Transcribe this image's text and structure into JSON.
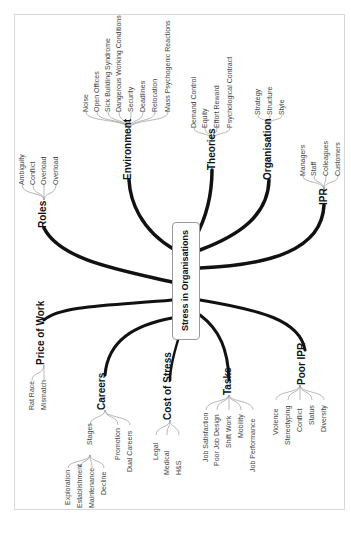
{
  "central_topic": "Stress in Organisations",
  "branches": [
    {
      "label": "Roles",
      "children": [
        "Ambiguity",
        "Conflict",
        "Overload",
        "Overload"
      ]
    },
    {
      "label": "Environment",
      "children": [
        "Noise",
        "Open Offices",
        "Sick Building Syndrome",
        "Dangerous Working Conditions",
        "Security",
        "Deadlines",
        "Relocation",
        "Mass Psychogenic Reactions"
      ]
    },
    {
      "label": "Theories",
      "children": [
        "Demand Control",
        "Equity",
        "Effort Reward",
        "Psychological Contract"
      ]
    },
    {
      "label": "Organisation",
      "children": [
        "Strategy",
        "Structure",
        "Style"
      ]
    },
    {
      "label": "IPR",
      "children": [
        "Managers",
        "Staff",
        "Colleagues",
        "Customers"
      ]
    },
    {
      "label": "Price of Work",
      "children": [
        "Rat Race",
        "Mismatch"
      ]
    },
    {
      "label": "Careers",
      "children": [
        "Stages",
        "Promotion",
        "Dual Careers"
      ],
      "stages": [
        "Exploration",
        "Establishment",
        "Maintenance",
        "Decline"
      ]
    },
    {
      "label": "Cost of Stress",
      "children": [
        "Legal",
        "Medical",
        "H&S"
      ]
    },
    {
      "label": "Tasks",
      "children": [
        "Job Satisfaction",
        "Poor Job Design",
        "Shift Work",
        "Mobility",
        "Job Performance"
      ]
    },
    {
      "label": "Poor IPR",
      "children": [
        "Violence",
        "Stereotyping",
        "Conflict",
        "Status",
        "Diversity"
      ]
    }
  ],
  "colors": {
    "link": "#111111",
    "leaf_line": "#999999",
    "frame": "#d8d8d8"
  }
}
